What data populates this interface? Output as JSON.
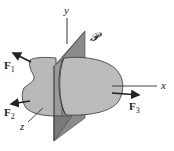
{
  "diagram": {
    "type": "free-body / section plane illustration",
    "axes": {
      "y_label": "y",
      "x_label": "x",
      "z_label": "z"
    },
    "plane": {
      "label": "𝓟",
      "color": "#7a7a7a"
    },
    "body": {
      "fill": "#b9b9b9",
      "stroke": "#333333"
    },
    "forces": [
      {
        "id": "F1",
        "label": "F",
        "subscript": "1"
      },
      {
        "id": "F2",
        "label": "F",
        "subscript": "2"
      },
      {
        "id": "F3",
        "label": "F",
        "subscript": "3"
      }
    ]
  }
}
